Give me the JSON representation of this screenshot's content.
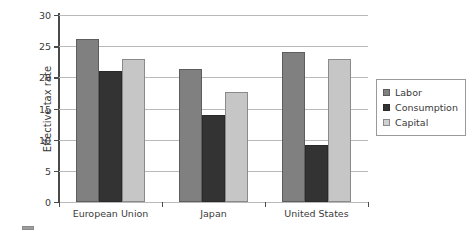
{
  "chart_data": {
    "type": "bar",
    "title": "",
    "subtitle": "",
    "xlabel": "",
    "ylabel": "Effective tax rate",
    "categories": [
      "European Union",
      "Japan",
      "United States"
    ],
    "series": [
      {
        "name": "Labor",
        "values": [
          26.2,
          21.4,
          24.0
        ],
        "color": "#808080"
      },
      {
        "name": "Consumption",
        "values": [
          21.0,
          13.9,
          9.2
        ],
        "color": "#333333"
      },
      {
        "name": "Capital",
        "values": [
          23.0,
          17.7,
          23.0
        ],
        "color": "#c6c6c6"
      }
    ],
    "ylim": [
      0,
      30
    ],
    "yticks": [
      0,
      5,
      10,
      15,
      20,
      25,
      30
    ],
    "ytick_labels": [
      "0",
      "5",
      "10",
      "15",
      "20",
      "25",
      "30"
    ],
    "grid": true,
    "grid_axis": "y",
    "legend_position": "right"
  },
  "legend": {
    "items": [
      {
        "label": "Labor",
        "swatch": "labor-swatch-icon"
      },
      {
        "label": "Consumption",
        "swatch": "consumption-swatch-icon"
      },
      {
        "label": "Capital",
        "swatch": "capital-swatch-icon"
      }
    ]
  }
}
